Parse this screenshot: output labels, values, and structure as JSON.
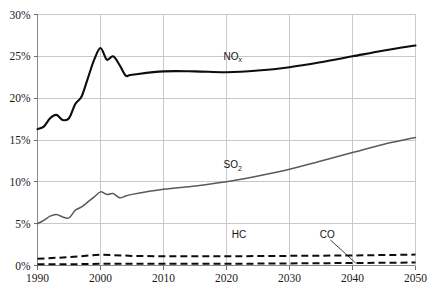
{
  "chart_data": {
    "type": "line",
    "title": "",
    "subtitle": "",
    "xlabel": "",
    "ylabel": "",
    "xlim": [
      1990,
      2050
    ],
    "ylim": [
      0,
      30
    ],
    "grid": true,
    "legend_position": "inline-annotations",
    "y_tick_labels": [
      "0%",
      "5%",
      "10%",
      "15%",
      "20%",
      "25%",
      "30%"
    ],
    "y_tick_values": [
      0,
      5,
      10,
      15,
      20,
      25,
      30
    ],
    "x_tick_labels": [
      "1990",
      "2000",
      "2010",
      "2020",
      "2030",
      "2040",
      "2050"
    ],
    "x_tick_values": [
      1990,
      2000,
      2010,
      2020,
      2030,
      2040,
      2050
    ],
    "annotations": [
      {
        "text": "NO",
        "sub": "x",
        "x": 2021,
        "y": 24.6
      },
      {
        "text": "SO",
        "sub": "2",
        "x": 2021,
        "y": 11.6
      },
      {
        "text": "HC",
        "sub": "",
        "x": 2022,
        "y": 3.3
      },
      {
        "text": "CO",
        "sub": "",
        "x": 2036,
        "y": 3.3
      }
    ],
    "series": [
      {
        "name": "NOx",
        "style": "solid",
        "color": "#0d0d0d",
        "width": 2.1,
        "x": [
          1990,
          1991,
          1992,
          1993,
          1994,
          1995,
          1996,
          1997,
          1998,
          1999,
          2000,
          2001,
          2002,
          2003,
          2004,
          2005,
          2010,
          2015,
          2020,
          2025,
          2030,
          2035,
          2040,
          2045,
          2050
        ],
        "values": [
          16.3,
          16.6,
          17.6,
          18.0,
          17.4,
          17.6,
          19.3,
          20.2,
          22.4,
          24.6,
          26.0,
          24.6,
          25.0,
          24.0,
          22.7,
          22.8,
          23.2,
          23.2,
          23.1,
          23.3,
          23.7,
          24.3,
          25.0,
          25.7,
          26.3
        ]
      },
      {
        "name": "SO2",
        "style": "solid",
        "color": "#5a5a5a",
        "width": 1.5,
        "x": [
          1990,
          1991,
          1992,
          1993,
          1994,
          1995,
          1996,
          1997,
          1998,
          1999,
          2000,
          2001,
          2002,
          2003,
          2004,
          2005,
          2010,
          2015,
          2020,
          2025,
          2030,
          2035,
          2040,
          2045,
          2050
        ],
        "values": [
          5.0,
          5.4,
          5.9,
          6.1,
          5.8,
          5.7,
          6.6,
          7.0,
          7.6,
          8.2,
          8.8,
          8.5,
          8.6,
          8.1,
          8.3,
          8.5,
          9.1,
          9.5,
          10.0,
          10.7,
          11.5,
          12.5,
          13.5,
          14.5,
          15.3
        ]
      },
      {
        "name": "HC",
        "style": "dashed",
        "color": "#0d0d0d",
        "width": 2,
        "x": [
          1990,
          1995,
          2000,
          2005,
          2010,
          2020,
          2030,
          2040,
          2050
        ],
        "values": [
          0.8,
          1.0,
          1.3,
          1.15,
          1.1,
          1.1,
          1.15,
          1.2,
          1.3
        ]
      },
      {
        "name": "CO",
        "style": "dashed",
        "color": "#0d0d0d",
        "width": 2,
        "x": [
          1990,
          1995,
          2000,
          2005,
          2010,
          2020,
          2030,
          2040,
          2050
        ],
        "values": [
          0.15,
          0.15,
          0.2,
          0.2,
          0.2,
          0.2,
          0.25,
          0.3,
          0.35
        ]
      }
    ]
  }
}
